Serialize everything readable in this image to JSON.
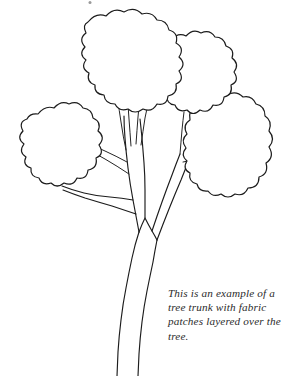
{
  "document": {
    "title": "Tree trunk with fabric patches",
    "background_color": "#ffffff",
    "ink_color": "#1c1c1c",
    "text_color": "#2b2b2b",
    "width": 307,
    "height": 376
  },
  "caption": {
    "full_text": "This is an example of a tree trunk with fabric patches layered over the tree.",
    "lines": [
      "This is an example of a",
      "tree trunk with fabric",
      "patches layered over the",
      "tree."
    ]
  },
  "illustration": {
    "subject": "line-art tree outline",
    "style": "uncolored black outline drawing",
    "parts": [
      {
        "name": "foliage-cluster-top-center",
        "description": "large scalloped canopy blob at top center"
      },
      {
        "name": "foliage-cluster-upper-right",
        "description": "scalloped canopy blob at upper right"
      },
      {
        "name": "foliage-cluster-left",
        "description": "scalloped canopy blob at left"
      },
      {
        "name": "foliage-cluster-lower-right",
        "description": "scalloped canopy blob at lower right"
      },
      {
        "name": "trunk",
        "description": "vertical trunk running to bottom edge"
      },
      {
        "name": "branch-fork",
        "description": "Y-shaped fork splitting trunk into two limbs"
      },
      {
        "name": "branch-left-sweep",
        "description": "branch sweeping down and left toward left cluster"
      },
      {
        "name": "twigs-center",
        "description": "thin twigs rising into the top center canopy"
      },
      {
        "name": "twigs-right",
        "description": "thin twigs rising into the right canopy"
      }
    ]
  }
}
